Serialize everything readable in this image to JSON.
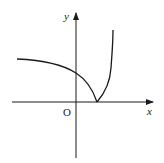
{
  "diagram": {
    "type": "function-graph",
    "axes": {
      "x_label": "x",
      "y_label": "y",
      "origin_label": "O"
    },
    "curves": [
      {
        "name": "left-branch",
        "description": "decreasing concave-down curve from upper left, crossing y-axis, meeting x-axis at cusp on positive x side"
      },
      {
        "name": "right-branch",
        "description": "increasing concave-up curve rising steeply from cusp on x-axis"
      }
    ],
    "colors": {
      "stroke": "#1a1a1a",
      "background": "#ffffff"
    }
  }
}
